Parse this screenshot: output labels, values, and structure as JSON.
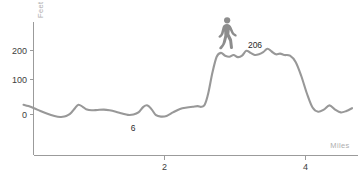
{
  "chart_data": {
    "type": "area",
    "title": "",
    "subtitle": "",
    "xlabel": "Miles",
    "ylabel": "Feet",
    "xlim": [
      0,
      4.7
    ],
    "ylim": [
      -40,
      260
    ],
    "grid": false,
    "legend": null,
    "x_ticks": [
      {
        "value": 2,
        "label": "2"
      },
      {
        "value": 4,
        "label": "4"
      }
    ],
    "y_ticks": [
      {
        "value": 0,
        "label": "0"
      },
      {
        "value": 100,
        "label": "100"
      },
      {
        "value": 200,
        "label": "200"
      }
    ],
    "annotations": [
      {
        "name": "low-point-label",
        "label": "6",
        "x": 1.63,
        "y": 6
      },
      {
        "name": "high-point-label",
        "label": "206",
        "x": 2.95,
        "y": 206
      }
    ],
    "marker": {
      "name": "walking-person-icon",
      "icon": "pedestrian-icon",
      "x": 2.65,
      "y": 206
    },
    "series": [
      {
        "name": "Elevation profile",
        "color": "#989898",
        "x": [
          0.0,
          0.07,
          0.15,
          0.24,
          0.34,
          0.44,
          0.52,
          0.58,
          0.63,
          0.68,
          0.73,
          0.78,
          0.84,
          0.9,
          0.97,
          1.05,
          1.14,
          1.22,
          1.31,
          1.4,
          1.48,
          1.56,
          1.63,
          1.7,
          1.76,
          1.82,
          1.88,
          1.95,
          2.03,
          2.12,
          2.22,
          2.32,
          2.4,
          2.47,
          2.52,
          2.57,
          2.62,
          2.68,
          2.74,
          2.8,
          2.86,
          2.92,
          2.98,
          3.04,
          3.1,
          3.16,
          3.22,
          3.28,
          3.34,
          3.4,
          3.46,
          3.52,
          3.58,
          3.64,
          3.7,
          3.78,
          3.86,
          3.94,
          4.02,
          4.1,
          4.18,
          4.26,
          4.34,
          4.42,
          4.5,
          4.58,
          4.66
        ],
        "y": [
          28,
          24,
          18,
          10,
          2,
          -4,
          -7,
          -6,
          -2,
          6,
          18,
          28,
          22,
          14,
          12,
          13,
          14,
          12,
          8,
          3,
          -1,
          0,
          6,
          22,
          26,
          14,
          -2,
          -6,
          -4,
          6,
          16,
          20,
          22,
          24,
          22,
          28,
          60,
          120,
          165,
          176,
          168,
          165,
          170,
          164,
          168,
          182,
          176,
          170,
          172,
          178,
          188,
          180,
          172,
          174,
          170,
          168,
          150,
          110,
          60,
          20,
          8,
          14,
          26,
          14,
          6,
          10,
          18
        ]
      }
    ]
  },
  "figure": {
    "background_color": "#ffffff",
    "axis_color": "#9b9b9b",
    "line_color": "#989898",
    "icon_color": "#8d8d8d"
  }
}
